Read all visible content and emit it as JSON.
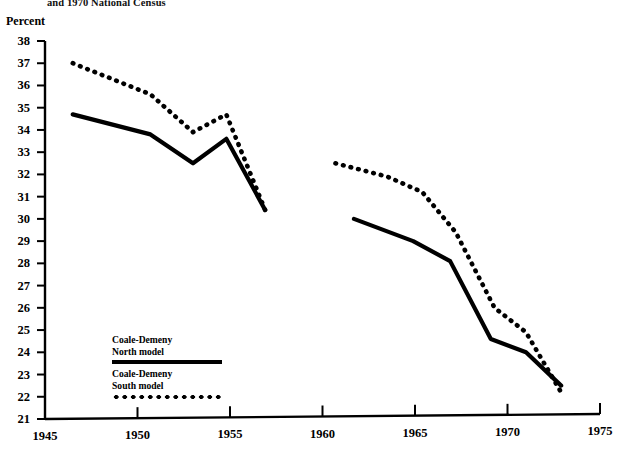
{
  "title": "and 1970 National Census",
  "chart_data": {
    "type": "line",
    "title": "and 1970 National Census",
    "xlabel": "",
    "ylabel": "Percent",
    "xlim": [
      1945,
      1975
    ],
    "ylim": [
      21,
      38
    ],
    "xticks": [
      1945,
      1950,
      1955,
      1960,
      1965,
      1970,
      1975
    ],
    "yticks": [
      21,
      22,
      23,
      24,
      25,
      26,
      27,
      28,
      29,
      30,
      31,
      32,
      33,
      34,
      35,
      36,
      37,
      38
    ],
    "grid": false,
    "legend_position": "lower-left-inside",
    "series": [
      {
        "name": "Coale-Demeny North model",
        "style": "solid",
        "color": "#000000",
        "segments": [
          {
            "x": [
              1946.5,
              1950.7,
              1953.0,
              1954.8,
              1956.9
            ],
            "y": [
              34.7,
              33.8,
              32.5,
              33.6,
              30.4
            ]
          },
          {
            "x": [
              1961.7,
              1964.9,
              1966.9,
              1969.1,
              1971.0,
              1972.9
            ],
            "y": [
              30.0,
              29.0,
              28.1,
              24.6,
              24.0,
              22.5
            ]
          }
        ]
      },
      {
        "name": "Coale-Demeny South model",
        "style": "dotted",
        "color": "#000000",
        "segments": [
          {
            "x": [
              1946.5,
              1950.7,
              1953.0,
              1954.8,
              1956.9
            ],
            "y": [
              37.0,
              35.6,
              33.9,
              34.7,
              30.4
            ]
          },
          {
            "x": [
              1960.7,
              1963.5,
              1965.4,
              1967.2,
              1969.3,
              1971.0,
              1972.9
            ],
            "y": [
              32.5,
              31.9,
              31.2,
              29.4,
              26.0,
              24.9,
              22.2
            ]
          }
        ]
      }
    ]
  },
  "legend": {
    "entries": [
      {
        "line1": "Coale-Demeny",
        "line2": "North model",
        "style": "solid"
      },
      {
        "line1": "Coale-Demeny",
        "line2": "South model",
        "style": "dotted"
      }
    ]
  }
}
